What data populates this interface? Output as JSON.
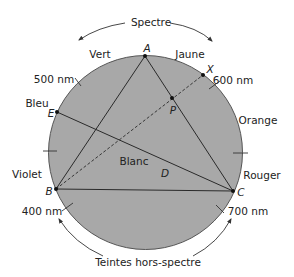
{
  "colors": {
    "circle_fill": "#a8a8a8",
    "circle_stroke": "#555555",
    "line": "#2a2a2a",
    "text": "#222222",
    "background": "#ffffff"
  },
  "circle": {
    "cx": 145.5,
    "cy": 152.5,
    "r": 97
  },
  "top_label": "Spectre",
  "bottom_label": "Teintes hors-spectre",
  "color_labels": {
    "vert": "Vert",
    "jaune": "Jaune",
    "bleu": "Bleu",
    "orange": "Orange",
    "violet": "Violet",
    "rouge": "Rouger",
    "blanc": "Blanc"
  },
  "wavelengths": {
    "w500": "500 nm",
    "w600": "600 nm",
    "w400": "400 nm",
    "w700": "700 nm"
  },
  "points": {
    "A": {
      "label": "A",
      "x": 145,
      "y": 56
    },
    "B": {
      "label": "B",
      "x": 56,
      "y": 189
    },
    "C": {
      "label": "C",
      "x": 233,
      "y": 191
    },
    "E": {
      "label": "E",
      "x": 57,
      "y": 112
    },
    "X": {
      "label": "X",
      "x": 203,
      "y": 75
    },
    "P": {
      "label": "P",
      "x": 172,
      "y": 98
    },
    "D": {
      "label": "D"
    }
  }
}
